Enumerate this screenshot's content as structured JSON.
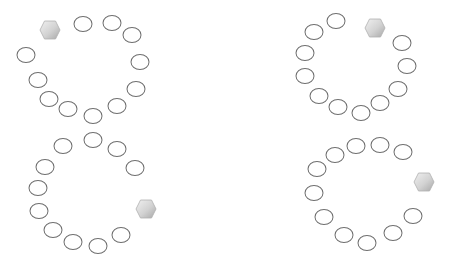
{
  "canvas": {
    "width": 456,
    "height": 269,
    "background": "#ffffff"
  },
  "colors": {
    "ring_stroke": "#6e6e6e",
    "hex_fill_light": "#e6e6e6",
    "hex_fill_dark": "#b4b4b4"
  },
  "clusters": [
    {
      "name": "top-left",
      "marker": {
        "shape": "hexagon",
        "x": 50,
        "y": 30
      },
      "rings": [
        {
          "x": 83,
          "y": 24
        },
        {
          "x": 112,
          "y": 23
        },
        {
          "x": 132,
          "y": 35
        },
        {
          "x": 140,
          "y": 62
        },
        {
          "x": 136,
          "y": 89
        },
        {
          "x": 117,
          "y": 106
        },
        {
          "x": 93,
          "y": 116
        },
        {
          "x": 68,
          "y": 109
        },
        {
          "x": 49,
          "y": 99
        },
        {
          "x": 38,
          "y": 80
        },
        {
          "x": 26,
          "y": 55
        }
      ]
    },
    {
      "name": "bottom-left",
      "marker": {
        "shape": "hexagon",
        "x": 146,
        "y": 209
      },
      "rings": [
        {
          "x": 93,
          "y": 140
        },
        {
          "x": 63,
          "y": 146
        },
        {
          "x": 45,
          "y": 167
        },
        {
          "x": 38,
          "y": 188
        },
        {
          "x": 39,
          "y": 211
        },
        {
          "x": 53,
          "y": 230
        },
        {
          "x": 73,
          "y": 242
        },
        {
          "x": 98,
          "y": 246
        },
        {
          "x": 121,
          "y": 235
        },
        {
          "x": 117,
          "y": 149
        },
        {
          "x": 135,
          "y": 168
        }
      ]
    },
    {
      "name": "top-right",
      "marker": {
        "shape": "hexagon",
        "x": 375,
        "y": 28
      },
      "rings": [
        {
          "x": 336,
          "y": 21
        },
        {
          "x": 314,
          "y": 32
        },
        {
          "x": 305,
          "y": 53
        },
        {
          "x": 305,
          "y": 76
        },
        {
          "x": 319,
          "y": 96
        },
        {
          "x": 338,
          "y": 107
        },
        {
          "x": 361,
          "y": 113
        },
        {
          "x": 380,
          "y": 103
        },
        {
          "x": 398,
          "y": 89
        },
        {
          "x": 407,
          "y": 66
        },
        {
          "x": 402,
          "y": 43
        }
      ]
    },
    {
      "name": "bottom-right",
      "marker": {
        "shape": "hexagon",
        "x": 424,
        "y": 182
      },
      "rings": [
        {
          "x": 403,
          "y": 152
        },
        {
          "x": 380,
          "y": 145
        },
        {
          "x": 356,
          "y": 146
        },
        {
          "x": 335,
          "y": 155
        },
        {
          "x": 317,
          "y": 169
        },
        {
          "x": 314,
          "y": 193
        },
        {
          "x": 324,
          "y": 217
        },
        {
          "x": 344,
          "y": 235
        },
        {
          "x": 367,
          "y": 243
        },
        {
          "x": 393,
          "y": 233
        },
        {
          "x": 413,
          "y": 216
        }
      ]
    }
  ]
}
